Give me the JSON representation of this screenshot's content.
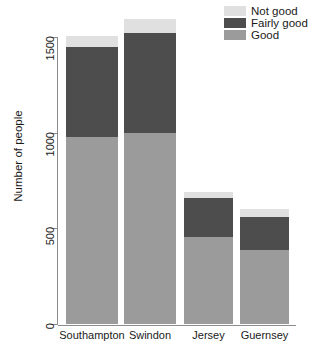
{
  "chart_data": {
    "type": "bar",
    "stacked": true,
    "title": "",
    "xlabel": "",
    "ylabel": "Number of people",
    "categories": [
      "Southampton",
      "Swindon",
      "Jersey",
      "Guernsey"
    ],
    "series": [
      {
        "name": "Good",
        "color": "#9b9b9b",
        "values": [
          980,
          1000,
          455,
          387
        ]
      },
      {
        "name": "Fairly good",
        "color": "#4d4d4d",
        "values": [
          468,
          520,
          203,
          172
        ]
      },
      {
        "name": "Not good",
        "color": "#e0e0e0",
        "values": [
          57,
          75,
          32,
          42
        ]
      }
    ],
    "totals": [
      1505,
      1595,
      690,
      601
    ],
    "ylim": [
      0,
      1600
    ],
    "yticks": [
      0,
      500,
      1000,
      1500
    ],
    "ytick_labels": [
      "0",
      "500",
      "1000",
      "1500"
    ],
    "grid": false,
    "legend_position": "top-right",
    "legend_order": [
      "Not good",
      "Fairly good",
      "Good"
    ],
    "axis_color": "#8c8c8c",
    "background": "#ffffff"
  },
  "legend": {
    "items": [
      {
        "label": "Not good",
        "color": "#e0e0e0"
      },
      {
        "label": "Fairly good",
        "color": "#4d4d4d"
      },
      {
        "label": "Good",
        "color": "#9b9b9b"
      }
    ]
  },
  "axes": {
    "y_title": "Number of people",
    "y_tick_labels": [
      "0",
      "500",
      "1000",
      "1500"
    ],
    "x_tick_labels": [
      "Southampton",
      "Swindon",
      "Jersey",
      "Guernsey"
    ]
  }
}
